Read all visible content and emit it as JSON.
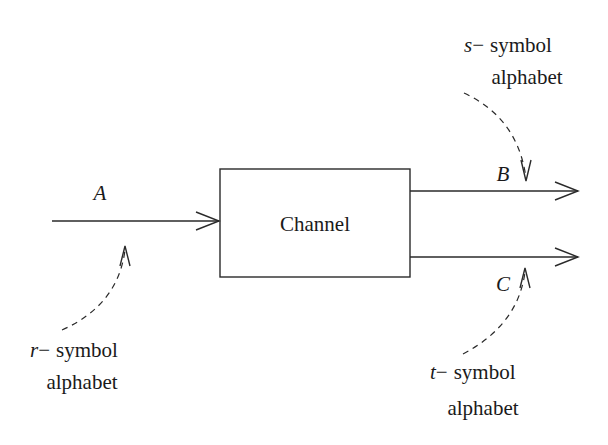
{
  "diagram": {
    "channel": {
      "label": "Channel"
    },
    "input": {
      "label": "A",
      "alphabet_var": "r",
      "alphabet_text": "symbol",
      "alphabet_line2": "alphabet",
      "dash": "−"
    },
    "output_b": {
      "label": "B",
      "alphabet_var": "s",
      "alphabet_text": "symbol",
      "alphabet_line2": "alphabet",
      "dash": "−"
    },
    "output_c": {
      "label": "C",
      "alphabet_var": "t",
      "alphabet_text": "symbol",
      "alphabet_line2": "alphabet",
      "dash": "−"
    },
    "colors": {
      "stroke": "#2a2a2a",
      "text": "#1a1a1a",
      "background": "#ffffff"
    }
  }
}
